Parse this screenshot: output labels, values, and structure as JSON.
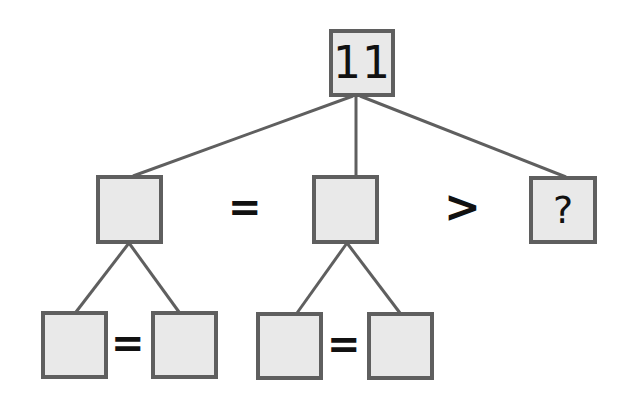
{
  "diagram": {
    "type": "number-tree-puzzle",
    "colors": {
      "box_fill": "#e9e9e9",
      "box_border": "#5f5f5f",
      "edge": "#5f5f5f",
      "text": "#111111"
    },
    "nodes": {
      "root": {
        "label": "11",
        "x": 329,
        "y": 29,
        "w": 66,
        "h": 68
      },
      "mid_left": {
        "label": "",
        "x": 96,
        "y": 175,
        "w": 67,
        "h": 69
      },
      "mid_center": {
        "label": "",
        "x": 312,
        "y": 175,
        "w": 67,
        "h": 69
      },
      "mid_right": {
        "label": "?",
        "x": 529,
        "y": 176,
        "w": 68,
        "h": 68
      },
      "leaf_1": {
        "label": "",
        "x": 41,
        "y": 311,
        "w": 67,
        "h": 68
      },
      "leaf_2": {
        "label": "",
        "x": 151,
        "y": 311,
        "w": 67,
        "h": 68
      },
      "leaf_3": {
        "label": "",
        "x": 256,
        "y": 312,
        "w": 67,
        "h": 68
      },
      "leaf_4": {
        "label": "",
        "x": 367,
        "y": 312,
        "w": 67,
        "h": 68
      }
    },
    "operators": {
      "mid_eq": {
        "symbol": "=",
        "x": 228,
        "y": 187,
        "size": 40
      },
      "mid_gt": {
        "symbol": ">",
        "x": 444,
        "y": 185,
        "size": 44
      },
      "leaf_eq_left": {
        "symbol": "=",
        "x": 111,
        "y": 323,
        "size": 40
      },
      "leaf_eq_right": {
        "symbol": "=",
        "x": 327,
        "y": 324,
        "size": 40
      }
    },
    "edges": [
      {
        "from": "root",
        "to": "mid_left",
        "x1": 353,
        "y1": 96,
        "x2": 133,
        "y2": 176
      },
      {
        "from": "root",
        "to": "mid_center",
        "x1": 356,
        "y1": 96,
        "x2": 356,
        "y2": 176
      },
      {
        "from": "root",
        "to": "mid_right",
        "x1": 360,
        "y1": 96,
        "x2": 566,
        "y2": 177
      },
      {
        "from": "mid_left",
        "to": "leaf_1",
        "x1": 129,
        "y1": 243,
        "x2": 76,
        "y2": 312
      },
      {
        "from": "mid_left",
        "to": "leaf_2",
        "x1": 129,
        "y1": 243,
        "x2": 179,
        "y2": 312
      },
      {
        "from": "mid_center",
        "to": "leaf_3",
        "x1": 347,
        "y1": 243,
        "x2": 297,
        "y2": 313
      },
      {
        "from": "mid_center",
        "to": "leaf_4",
        "x1": 347,
        "y1": 243,
        "x2": 400,
        "y2": 313
      }
    ]
  }
}
